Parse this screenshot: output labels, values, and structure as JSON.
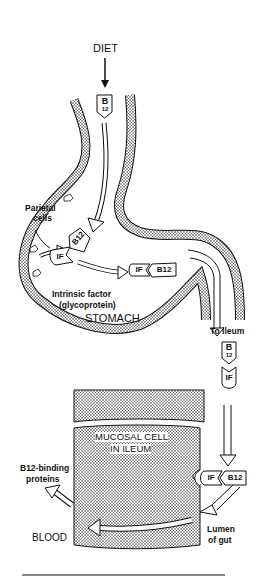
{
  "labels": {
    "diet": "DIET",
    "parietal_cells_line1": "Parietal",
    "parietal_cells_line2": "cells",
    "intrinsic_factor_line1": "Intrinsic factor",
    "intrinsic_factor_line2": "(glycoprotein)",
    "stomach": "STOMACH",
    "to_ileum": "To ileum",
    "mucosal_cell_line1": "MUCOSAL CELL",
    "mucosal_cell_line2": "IN ILEUM",
    "b12_binding_line1": "B12-binding",
    "b12_binding_line2": "proteins",
    "blood": "BLOOD",
    "lumen_line1": "Lumen",
    "lumen_line2": "of gut"
  },
  "tags": {
    "b12_top": "B",
    "b12_sub": "12",
    "if": "IF",
    "b12": "B12"
  }
}
